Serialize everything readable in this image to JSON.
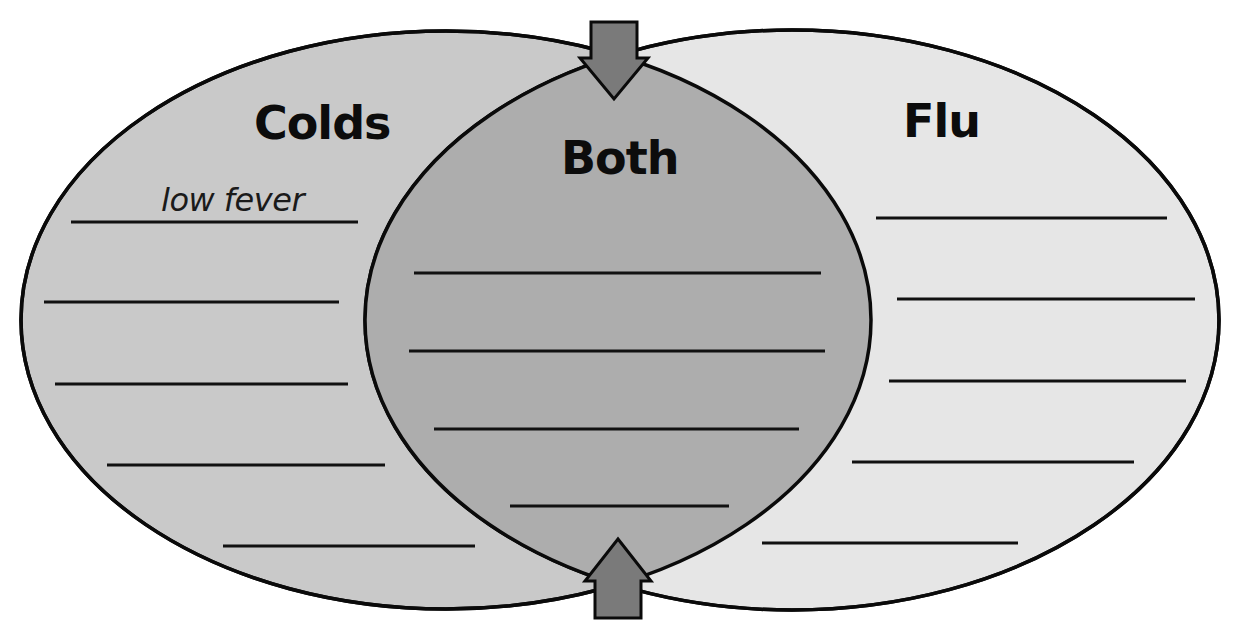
{
  "diagram": {
    "type": "venn",
    "colors": {
      "left_fill": "#c9c9c9",
      "right_fill": "#e6e6e6",
      "overlap_fill": "#adadad",
      "arrow_fill": "#7a7a7a",
      "outline": "#0a0a0a"
    },
    "left": {
      "title": "Colds",
      "entries": [
        "low fever",
        "",
        "",
        "",
        ""
      ]
    },
    "center": {
      "title": "Both",
      "entries": [
        "",
        "",
        "",
        ""
      ]
    },
    "right": {
      "title": "Flu",
      "entries": [
        "",
        "",
        "",
        "",
        ""
      ]
    },
    "arrows": [
      {
        "position": "top",
        "direction": "down",
        "icon": "arrow-down-icon"
      },
      {
        "position": "bottom",
        "direction": "up",
        "icon": "arrow-up-icon"
      }
    ]
  }
}
